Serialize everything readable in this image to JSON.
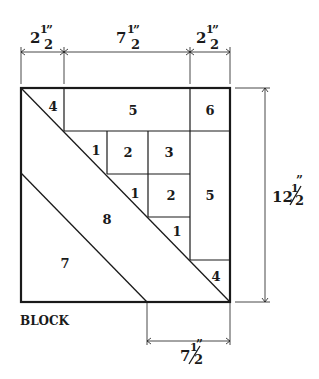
{
  "title": "BLOCK",
  "dimensions": {
    "top_left": {
      "whole": "2",
      "num": "1",
      "den": "2",
      "unit": "”"
    },
    "top_middle": {
      "whole": "7",
      "num": "1",
      "den": "2",
      "unit": "”"
    },
    "top_right": {
      "whole": "2",
      "num": "1",
      "den": "2",
      "unit": "”"
    },
    "right_side": {
      "whole": "12",
      "num": "1",
      "den": "2",
      "unit": "”"
    },
    "bottom": {
      "whole": "7",
      "num": "1",
      "den": "2",
      "unit": "”"
    }
  },
  "pieces": {
    "p4_top": "4",
    "p5_top": "5",
    "p6": "6",
    "p1_a": "1",
    "p2_a": "2",
    "p3": "3",
    "p1_b": "1",
    "p2_b": "2",
    "p5_right": "5",
    "p1_c": "1",
    "p8": "8",
    "p7": "7",
    "p4_bottom": "4"
  }
}
